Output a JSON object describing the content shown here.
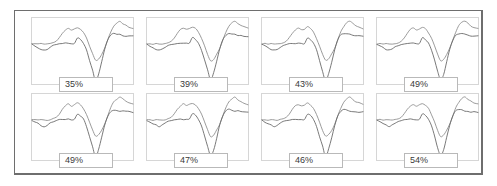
{
  "figure": {
    "type": "small-multiples-waveform-grid",
    "columns": 4,
    "rows": 2,
    "panel_count": 8,
    "frame_border_color": "#6e6e6e",
    "panel_border_color": "#d6d6d6",
    "label_border_color": "#b9b9b9",
    "trace_colors": [
      "#8d8d8d",
      "#666666"
    ]
  },
  "panels": [
    {
      "label": "35%",
      "value": 35,
      "row": 0,
      "col": 0
    },
    {
      "label": "39%",
      "value": 39,
      "row": 0,
      "col": 1
    },
    {
      "label": "43%",
      "value": 43,
      "row": 0,
      "col": 2
    },
    {
      "label": "49%",
      "value": 49,
      "row": 0,
      "col": 3
    },
    {
      "label": "49%",
      "value": 49,
      "row": 1,
      "col": 0
    },
    {
      "label": "47%",
      "value": 47,
      "row": 1,
      "col": 1
    },
    {
      "label": "46%",
      "value": 46,
      "row": 1,
      "col": 2
    },
    {
      "label": "54%",
      "value": 54,
      "row": 1,
      "col": 3
    }
  ],
  "chart_data": {
    "type": "line",
    "title": "",
    "xlabel": "",
    "ylabel": "",
    "grid": false,
    "legend": "none",
    "panel_labels": [
      "35%",
      "39%",
      "43%",
      "49%",
      "49%",
      "47%",
      "46%",
      "54%"
    ],
    "panel_values": [
      35,
      39,
      43,
      49,
      49,
      47,
      46,
      54
    ],
    "series": [
      {
        "name": "trace-a",
        "color": "#8d8d8d",
        "x": [
          0,
          3,
          6,
          9,
          12,
          15,
          18,
          21,
          24,
          27,
          30,
          33,
          36,
          39,
          42,
          45,
          48,
          51,
          54,
          57,
          60,
          63,
          66,
          69,
          72,
          75,
          78,
          81,
          84,
          87,
          90,
          93,
          96,
          100
        ],
        "values": [
          0.04,
          0.05,
          0.03,
          0.05,
          0.04,
          0.03,
          0.05,
          0.08,
          0.14,
          0.26,
          0.42,
          0.56,
          0.62,
          0.56,
          0.6,
          0.66,
          0.6,
          0.46,
          0.24,
          -0.04,
          -0.34,
          -0.58,
          -0.52,
          -0.34,
          -0.12,
          0.18,
          0.48,
          0.7,
          0.82,
          0.88,
          0.8,
          0.72,
          0.66,
          0.62
        ]
      },
      {
        "name": "trace-b",
        "color": "#666666",
        "x": [
          0,
          3,
          6,
          9,
          12,
          15,
          18,
          21,
          24,
          27,
          30,
          33,
          36,
          39,
          42,
          45,
          48,
          51,
          54,
          57,
          60,
          63,
          66,
          69,
          72,
          75,
          78,
          81,
          84,
          87,
          90,
          93,
          96,
          100
        ],
        "values": [
          0.02,
          -0.04,
          -0.1,
          -0.16,
          -0.2,
          -0.16,
          -0.08,
          -0.02,
          0.02,
          0.04,
          0.04,
          0.06,
          0.06,
          0.05,
          0.06,
          0.26,
          0.2,
          0.06,
          -0.2,
          -0.56,
          -0.96,
          -1.3,
          -1.06,
          -0.62,
          -0.16,
          0.18,
          0.36,
          0.42,
          0.4,
          0.38,
          0.36,
          0.34,
          0.34,
          0.32
        ]
      }
    ],
    "ylim": [
      -1.45,
      1.0
    ],
    "xlim": [
      0,
      100
    ]
  }
}
